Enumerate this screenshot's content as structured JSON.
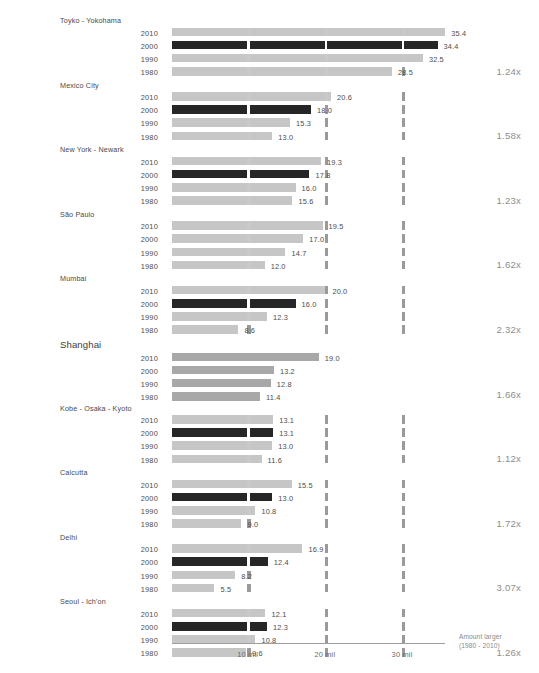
{
  "chart_data": {
    "type": "bar",
    "title": "",
    "xlabel": "",
    "ylabel": "",
    "xlim": [
      0,
      35.4
    ],
    "grid": true,
    "legend": "none",
    "x_tick_labels": [
      "10 mil",
      "20 mil",
      "30 mil"
    ],
    "x_tick_values": [
      10,
      20,
      30
    ],
    "axis_note_line1": "Amount larger",
    "axis_note_line2": "(1980 - 2010)",
    "categories": [
      "1980",
      "1990",
      "2000",
      "2010"
    ],
    "series_note": "Each city shows population in millions for 1980, 1990, 2000, 2010; multiplier is growth 1980-2010.",
    "cities": [
      {
        "name": "Toyko - Yokohama",
        "emphasis": false,
        "multiplier": "1.24x",
        "bars": [
          {
            "year": "2010",
            "value": 35.4,
            "label": "35.4",
            "dark": false
          },
          {
            "year": "2000",
            "value": 34.4,
            "label": "34.4",
            "dark": true
          },
          {
            "year": "1990",
            "value": 32.5,
            "label": "32.5",
            "dark": false
          },
          {
            "year": "1980",
            "value": 28.5,
            "label": "28.5",
            "dark": false
          }
        ]
      },
      {
        "name": "Mexico City",
        "emphasis": false,
        "multiplier": "1.58x",
        "bars": [
          {
            "year": "2010",
            "value": 20.6,
            "label": "20.6",
            "dark": false
          },
          {
            "year": "2000",
            "value": 18.0,
            "label": "18.0",
            "dark": true
          },
          {
            "year": "1990",
            "value": 15.3,
            "label": "15.3",
            "dark": false
          },
          {
            "year": "1980",
            "value": 13.0,
            "label": "13.0",
            "dark": false
          }
        ]
      },
      {
        "name": "New York - Newark",
        "emphasis": false,
        "multiplier": "1.23x",
        "bars": [
          {
            "year": "2010",
            "value": 19.3,
            "label": "19.3",
            "dark": false
          },
          {
            "year": "2000",
            "value": 17.8,
            "label": "17.8",
            "dark": true
          },
          {
            "year": "1990",
            "value": 16.0,
            "label": "16.0",
            "dark": false
          },
          {
            "year": "1980",
            "value": 15.6,
            "label": "15.6",
            "dark": false
          }
        ]
      },
      {
        "name": "São Paulo",
        "emphasis": false,
        "multiplier": "1.62x",
        "bars": [
          {
            "year": "2010",
            "value": 19.5,
            "label": "19.5",
            "dark": false
          },
          {
            "year": "2000",
            "value": 17.0,
            "label": "17.0",
            "dark": false
          },
          {
            "year": "1990",
            "value": 14.7,
            "label": "14.7",
            "dark": false
          },
          {
            "year": "1980",
            "value": 12.0,
            "label": "12.0",
            "dark": false
          }
        ]
      },
      {
        "name": "Mumbai",
        "emphasis": false,
        "multiplier": "2.32x",
        "bars": [
          {
            "year": "2010",
            "value": 20.0,
            "label": "20.0",
            "dark": false
          },
          {
            "year": "2000",
            "value": 16.0,
            "label": "16.0",
            "dark": true
          },
          {
            "year": "1990",
            "value": 12.3,
            "label": "12.3",
            "dark": false
          },
          {
            "year": "1980",
            "value": 8.6,
            "label": "8.6",
            "dark": false
          }
        ]
      },
      {
        "name": "Shanghai",
        "emphasis": true,
        "multiplier": "1.66x",
        "bars": [
          {
            "year": "2010",
            "value": 19.0,
            "label": "19.0",
            "dark": false,
            "mid": true
          },
          {
            "year": "2000",
            "value": 13.2,
            "label": "13.2",
            "dark": false,
            "mid": true
          },
          {
            "year": "1990",
            "value": 12.8,
            "label": "12.8",
            "dark": false,
            "mid": true
          },
          {
            "year": "1980",
            "value": 11.4,
            "label": "11.4",
            "dark": false,
            "mid": true
          }
        ]
      },
      {
        "name": "Kobe - Osaka - Kyoto",
        "emphasis": false,
        "multiplier": "1.12x",
        "bars": [
          {
            "year": "2010",
            "value": 13.1,
            "label": "13.1",
            "dark": false
          },
          {
            "year": "2000",
            "value": 13.1,
            "label": "13.1",
            "dark": true
          },
          {
            "year": "1990",
            "value": 13.0,
            "label": "13.0",
            "dark": false
          },
          {
            "year": "1980",
            "value": 11.6,
            "label": "11.6",
            "dark": false
          }
        ]
      },
      {
        "name": "Calcutta",
        "emphasis": false,
        "multiplier": "1.72x",
        "bars": [
          {
            "year": "2010",
            "value": 15.5,
            "label": "15.5",
            "dark": false
          },
          {
            "year": "2000",
            "value": 13.0,
            "label": "13.0",
            "dark": true
          },
          {
            "year": "1990",
            "value": 10.8,
            "label": "10.8",
            "dark": false
          },
          {
            "year": "1980",
            "value": 9.0,
            "label": "9.0",
            "dark": false
          }
        ]
      },
      {
        "name": "Delhi",
        "emphasis": false,
        "multiplier": "3.07x",
        "bars": [
          {
            "year": "2010",
            "value": 16.9,
            "label": "16.9",
            "dark": false
          },
          {
            "year": "2000",
            "value": 12.4,
            "label": "12.4",
            "dark": true
          },
          {
            "year": "1990",
            "value": 8.2,
            "label": "8.2",
            "dark": false
          },
          {
            "year": "1980",
            "value": 5.5,
            "label": "5.5",
            "dark": false
          }
        ]
      },
      {
        "name": "Seoul - Ich'on",
        "emphasis": false,
        "multiplier": "1.26x",
        "bars": [
          {
            "year": "2010",
            "value": 12.1,
            "label": "12.1",
            "dark": false
          },
          {
            "year": "2000",
            "value": 12.3,
            "label": "12.3",
            "dark": true
          },
          {
            "year": "1990",
            "value": 10.8,
            "label": "10.8",
            "dark": false
          },
          {
            "year": "1980",
            "value": 9.6,
            "label": "9.6",
            "dark": false
          }
        ]
      }
    ],
    "colors": {
      "bar_light": "#c6c6c6",
      "bar_mid": "#a8a8a8",
      "bar_dark": "#262626",
      "tick": "#9a9a9a",
      "axis": "#9e9e9e",
      "text": "#4d4d4d",
      "multiplier_text": "#8e8e8e"
    }
  }
}
